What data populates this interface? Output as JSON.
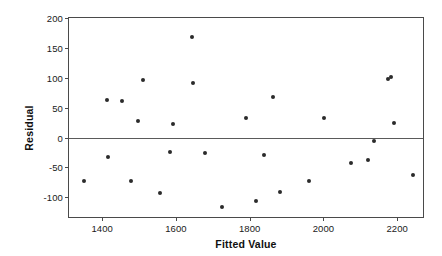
{
  "chart_data": {
    "type": "scatter",
    "title": "",
    "xlabel": "Fitted Value",
    "ylabel": "Residual",
    "xlim": [
      1310,
      2270
    ],
    "ylim": [
      -133,
      200
    ],
    "xticks": [
      1400,
      1600,
      1800,
      2000,
      2200
    ],
    "yticks": [
      200,
      150,
      100,
      50,
      0,
      -50,
      -100
    ],
    "grid": false,
    "legend": null,
    "reference_lines": [
      {
        "axis": "y",
        "value": 0
      }
    ],
    "marker_color": "#2b2b2b",
    "frame_color": "#4a4a4a",
    "background": "#ffffff",
    "points": [
      {
        "x": 1352,
        "y": -73
      },
      {
        "x": 1414,
        "y": 62
      },
      {
        "x": 1416,
        "y": -32
      },
      {
        "x": 1455,
        "y": 61
      },
      {
        "x": 1478,
        "y": -72
      },
      {
        "x": 1498,
        "y": 28
      },
      {
        "x": 1511,
        "y": 97
      },
      {
        "x": 1556,
        "y": -93
      },
      {
        "x": 1583,
        "y": -24
      },
      {
        "x": 1591,
        "y": 22
      },
      {
        "x": 1644,
        "y": 168
      },
      {
        "x": 1646,
        "y": 92
      },
      {
        "x": 1680,
        "y": -26
      },
      {
        "x": 1725,
        "y": -116
      },
      {
        "x": 1790,
        "y": 32
      },
      {
        "x": 1818,
        "y": -107
      },
      {
        "x": 1838,
        "y": -30
      },
      {
        "x": 1864,
        "y": 67
      },
      {
        "x": 1882,
        "y": -92
      },
      {
        "x": 1960,
        "y": -72
      },
      {
        "x": 2001,
        "y": 33
      },
      {
        "x": 2076,
        "y": -42
      },
      {
        "x": 2122,
        "y": -37
      },
      {
        "x": 2136,
        "y": -6
      },
      {
        "x": 2176,
        "y": 98
      },
      {
        "x": 2182,
        "y": 101
      },
      {
        "x": 2192,
        "y": 24
      },
      {
        "x": 2244,
        "y": -63
      }
    ]
  }
}
